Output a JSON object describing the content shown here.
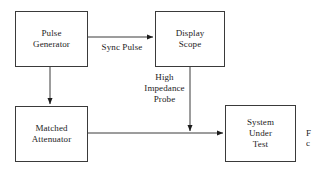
{
  "diagram": {
    "background_color": "#ffffff",
    "line_color": "#3a3a3a",
    "text_color": "#1c1c1c",
    "nodes": [
      {
        "id": "pulse-generator",
        "label": "Pulse\nGenerator",
        "x": 15,
        "y": 11,
        "w": 73,
        "h": 56
      },
      {
        "id": "display-scope",
        "label": "Display\nScope",
        "x": 155,
        "y": 11,
        "w": 70,
        "h": 56
      },
      {
        "id": "matched-attenuator",
        "label": "Matched\nAttenuator",
        "x": 15,
        "y": 106,
        "w": 73,
        "h": 56
      },
      {
        "id": "system-under-test",
        "label": "System\nUnder\nTest",
        "x": 225,
        "y": 105,
        "w": 71,
        "h": 57
      }
    ],
    "edge_labels": [
      {
        "id": "sync-pulse",
        "text": "Sync Pulse",
        "x": 92,
        "y": 42
      },
      {
        "id": "high-impedance-probe",
        "text": "High\nImpedance\nProbe",
        "x": 141,
        "y": 72
      }
    ],
    "caption_fragment": "F\nc"
  }
}
